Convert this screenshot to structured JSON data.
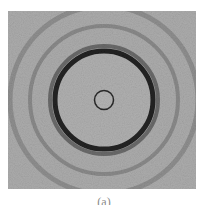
{
  "figure": {
    "caption": "(a)",
    "background_color": "#a9a9a9",
    "center": {
      "x": 96,
      "y": 89
    },
    "inner_circle": {
      "r": 9.5,
      "stroke": "#2a2a2a"
    },
    "main_ring": {
      "r": 49,
      "stroke": "#222222",
      "width": 5
    },
    "main_ring_halo": {
      "r": 54,
      "stroke": "#6a6a6a",
      "width": 4
    },
    "outer_rings": [
      {
        "r": 74,
        "stroke": "#8a8a8a",
        "width": 4
      },
      {
        "r": 94,
        "stroke": "#8f8f8f",
        "width": 5
      }
    ]
  }
}
